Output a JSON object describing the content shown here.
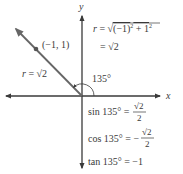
{
  "axes": {
    "x_label": "x",
    "y_label": "y",
    "axis_color": "#3a3a3a"
  },
  "ray": {
    "color": "#666666",
    "point_label": "(−1, 1)",
    "r_label_prefix": "r = ",
    "r_label_value": "√2"
  },
  "angle": {
    "label": "135°"
  },
  "formulas": {
    "r_line1": "r = √((−1)² + 1²)",
    "r_line1_prefix": "r = √",
    "r_line1_radicand": "(−1)",
    "r_line1_sup1": "2",
    "r_line1_plus": " + 1",
    "r_line1_sup2": "2",
    "r_line2": "= √2",
    "sin_lhs": "sin 135° = ",
    "sin_num": "√2",
    "sin_den": "2",
    "cos_lhs": "cos 135° = −",
    "cos_num": "√2",
    "cos_den": "2",
    "tan": "tan 135° = −1"
  }
}
